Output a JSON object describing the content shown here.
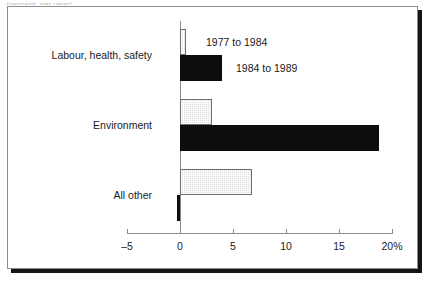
{
  "top_sliver_text": "(percent, per year)",
  "chart_data": {
    "type": "bar",
    "orientation": "horizontal",
    "title": "",
    "xlabel": "",
    "ylabel": "",
    "categories": [
      "Labour, health, safety",
      "Environment",
      "All other"
    ],
    "series": [
      {
        "name": "1977 to 1984",
        "style": "light-hatched",
        "values": [
          0.6,
          3.0,
          6.8
        ]
      },
      {
        "name": "1984 to 1989",
        "style": "solid-black",
        "values": [
          4.0,
          18.8,
          -0.3
        ]
      }
    ],
    "xlim": [
      -5,
      20
    ],
    "xticks": [
      -5,
      0,
      5,
      10,
      15,
      20
    ],
    "xtick_labels": [
      "–5",
      "0",
      "5",
      "10",
      "15",
      "20%"
    ],
    "grid": false,
    "legend_position": "inside-right-of-first-group",
    "zero_reference_line": true
  },
  "axis": {
    "ticks": [
      {
        "value": -5,
        "label": "–5"
      },
      {
        "value": 0,
        "label": "0"
      },
      {
        "value": 5,
        "label": "5"
      },
      {
        "value": 10,
        "label": "10"
      },
      {
        "value": 15,
        "label": "15"
      },
      {
        "value": 20,
        "label": "20%"
      }
    ]
  },
  "legend": {
    "entries": [
      {
        "label": "1977 to 1984",
        "swatch": "light-hatched"
      },
      {
        "label": "1984 to 1989",
        "swatch": "solid-black"
      }
    ]
  },
  "colors": {
    "series_1977_1984": "#dcdcdc",
    "series_1984_1989": "#0d0d0d",
    "axis": "#8b8b8b",
    "frame": "#8d8d8d",
    "shadow": "#151515",
    "text": "#1a1a1a"
  }
}
